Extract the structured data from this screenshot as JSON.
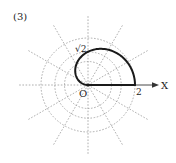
{
  "figure": {
    "label": "(3)",
    "axis_label": "X",
    "origin_label": "O",
    "tick_label_2": "2",
    "radius_label": "√2",
    "colors": {
      "curve": "#1a1a1a",
      "grid": "#9a9a9a",
      "axis": "#333333",
      "text": "#222222"
    }
  },
  "chart_data": {
    "type": "polar_curve",
    "title": "(3)",
    "equation": "r = 2cos(θ/2)",
    "theta_range": [
      0,
      3.14159
    ],
    "grid_circles": [
      1,
      1.41421,
      2
    ],
    "radial_rays_deg_step": 30,
    "annotations": [
      {
        "text": "O",
        "at": [
          0,
          0
        ]
      },
      {
        "text": "2",
        "at": [
          2,
          0
        ]
      },
      {
        "text": "√2",
        "at": [
          0,
          1.41421
        ]
      },
      {
        "text": "X",
        "at": "positive x-axis end"
      }
    ],
    "sample_points": [
      {
        "theta_deg": 0,
        "r": 2
      },
      {
        "theta_deg": 60,
        "r": 1.732
      },
      {
        "theta_deg": 90,
        "r": 1.414
      },
      {
        "theta_deg": 120,
        "r": 1
      },
      {
        "theta_deg": 180,
        "r": 0
      }
    ]
  }
}
